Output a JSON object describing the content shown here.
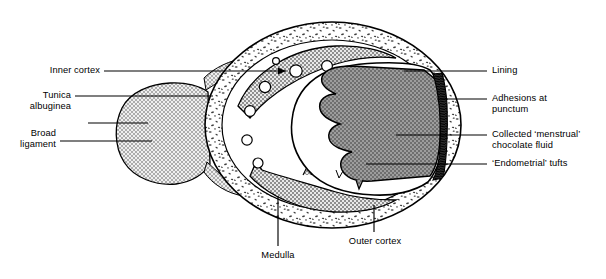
{
  "figure": {
    "colors": {
      "outline": "#000000",
      "cortex_fill": "#ffffff",
      "cortex_stipple": "#4a4a4a",
      "inner_cortex_band": "#b4b4b4",
      "chocolate_fluid": "#8a8a8a",
      "adhesion_band": "#2a2a2a",
      "broad_ligament": "#c9c9c9",
      "lining": "#ffffff",
      "leader_line": "#000000"
    }
  },
  "labels": {
    "left": [
      {
        "id": "inner-cortex",
        "text": "Inner cortex"
      },
      {
        "id": "tunica-albuginea",
        "text": "Tunica\nalbuginea"
      },
      {
        "id": "broad-ligament",
        "text": "Broad\nligament"
      }
    ],
    "right": [
      {
        "id": "lining",
        "text": "Lining"
      },
      {
        "id": "adhesions",
        "text": "Adhesions at\npunctum"
      },
      {
        "id": "chocolate-fluid",
        "text": "Collected ‘menstrual’\nchocolate fluid"
      },
      {
        "id": "endometrial-tufts",
        "text": "‘Endometrial’ tufts"
      }
    ],
    "bottom": [
      {
        "id": "medulla",
        "text": "Medulla"
      },
      {
        "id": "outer-cortex",
        "text": "Outer cortex"
      }
    ]
  },
  "structures": [
    {
      "id": "outer-cortex",
      "name": "Outer cortex"
    },
    {
      "id": "inner-cortex",
      "name": "Inner cortex"
    },
    {
      "id": "medulla",
      "name": "Medulla"
    },
    {
      "id": "tunica-albuginea",
      "name": "Tunica albuginea"
    },
    {
      "id": "broad-ligament",
      "name": "Broad ligament"
    },
    {
      "id": "chocolate-cyst",
      "name": "Collected ‘menstrual’ chocolate fluid"
    },
    {
      "id": "cyst-lining",
      "name": "Lining"
    },
    {
      "id": "adhesion-punctum",
      "name": "Adhesions at punctum"
    },
    {
      "id": "endometrial-tufts",
      "name": "‘Endometrial’ tufts"
    },
    {
      "id": "follicles",
      "name": "Follicles"
    }
  ]
}
